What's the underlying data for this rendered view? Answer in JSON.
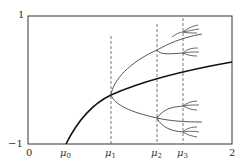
{
  "diagram": {
    "type": "bifurcation-diagram",
    "y_axis": {
      "top_label": "1",
      "bottom_label": "−1"
    },
    "x_axis": {
      "labels": [
        {
          "id": "zero",
          "text": "0"
        },
        {
          "id": "mu0",
          "base": "μ",
          "sub": "0"
        },
        {
          "id": "mu1",
          "base": "μ",
          "sub": "1"
        },
        {
          "id": "mu2",
          "base": "μ",
          "sub": "2"
        },
        {
          "id": "mu3",
          "base": "μ",
          "sub": "3"
        },
        {
          "id": "two",
          "text": "2"
        }
      ]
    },
    "colors": {
      "frame": "#333333",
      "main_curve": "#111111",
      "branches": "#444444",
      "dashed": "#555555"
    }
  }
}
